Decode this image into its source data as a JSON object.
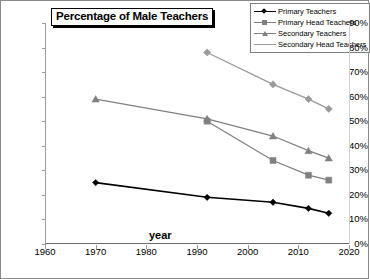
{
  "chart_data": {
    "type": "line",
    "title": "Percentage of Male Teachers",
    "xlabel": "year",
    "ylabel": "",
    "xlim": [
      1960,
      2020
    ],
    "ylim": [
      0,
      90
    ],
    "xticks": [
      1960,
      1970,
      1980,
      1990,
      2000,
      2010,
      2020
    ],
    "yticks": [
      0,
      10,
      20,
      30,
      40,
      50,
      60,
      70,
      80,
      90
    ],
    "ytick_labels": [
      "0%",
      "10%",
      "20%",
      "30%",
      "40%",
      "50%",
      "60%",
      "70%",
      "80%",
      "90%"
    ],
    "xtick_labels": [
      "1960",
      "1970",
      "1980",
      "1990",
      "2000",
      "2010",
      "2020"
    ],
    "grid": false,
    "legend_position": "top-right",
    "series": [
      {
        "name": "Primary Teachers",
        "color": "#000000",
        "marker": "diamond",
        "x": [
          1970,
          1992,
          2005,
          2012,
          2016
        ],
        "values": [
          25,
          19,
          17,
          14.5,
          12.5
        ]
      },
      {
        "name": "Primary Head Teachers",
        "color": "#808080",
        "marker": "square",
        "x": [
          1992,
          2005,
          2012,
          2016
        ],
        "values": [
          50,
          34,
          28,
          26
        ]
      },
      {
        "name": "Secondary Teachers",
        "color": "#808080",
        "marker": "triangle",
        "x": [
          1970,
          1992,
          2005,
          2012,
          2016
        ],
        "values": [
          59,
          51,
          44,
          38,
          35
        ]
      },
      {
        "name": "Secondary Head Teachers",
        "color": "#9a9a9a",
        "marker": "diamond",
        "x": [
          1992,
          2005,
          2012,
          2016
        ],
        "values": [
          78,
          65,
          59,
          55
        ]
      }
    ]
  }
}
